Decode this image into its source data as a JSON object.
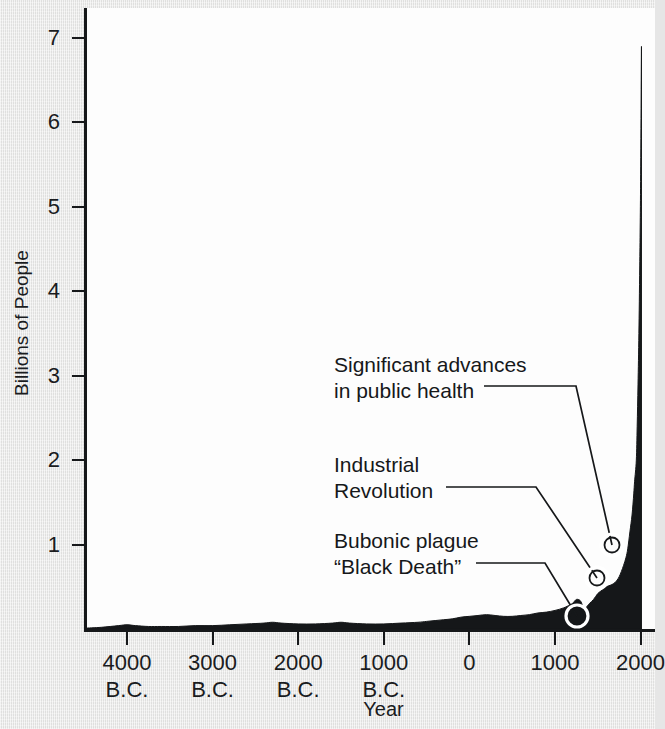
{
  "chart_data": {
    "type": "area",
    "title": "",
    "xlabel": "Year",
    "ylabel": "Billions of People",
    "ylim": [
      0,
      7.45
    ],
    "xlim": [
      -4500,
      2100
    ],
    "grid": false,
    "legend": null,
    "y_ticks": [
      {
        "value": 7,
        "label": "7"
      },
      {
        "value": 6,
        "label": "6"
      },
      {
        "value": 5,
        "label": "5"
      },
      {
        "value": 4,
        "label": "4"
      },
      {
        "value": 3,
        "label": "3"
      },
      {
        "value": 2,
        "label": "2"
      },
      {
        "value": 1,
        "label": "1"
      }
    ],
    "x_ticks": [
      {
        "value": -4000,
        "label": "4000\nB.C."
      },
      {
        "value": -3000,
        "label": "3000\nB.C."
      },
      {
        "value": -2000,
        "label": "2000\nB.C."
      },
      {
        "value": -1000,
        "label": "1000\nB.C."
      },
      {
        "value": 0,
        "label": "0"
      },
      {
        "value": 1000,
        "label": "1000"
      },
      {
        "value": 2000,
        "label": "2000"
      }
    ],
    "series": [
      {
        "name": "World population",
        "fill": "#151719",
        "x": [
          -4500,
          -4300,
          -4100,
          -4000,
          -3900,
          -3750,
          -3600,
          -3400,
          -3200,
          -3000,
          -2800,
          -2600,
          -2400,
          -2300,
          -2200,
          -2000,
          -1800,
          -1600,
          -1500,
          -1400,
          -1200,
          -1000,
          -800,
          -600,
          -500,
          -400,
          -300,
          -200,
          -100,
          0,
          100,
          200,
          300,
          400,
          500,
          600,
          700,
          800,
          900,
          1000,
          1100,
          1200,
          1250,
          1300,
          1340,
          1400,
          1450,
          1500,
          1550,
          1600,
          1650,
          1700,
          1750,
          1800,
          1830,
          1850,
          1875,
          1900,
          1920,
          1930,
          1950,
          1960,
          1970,
          1980,
          1990,
          2000,
          2010
        ],
        "y": [
          0.01,
          0.02,
          0.04,
          0.05,
          0.04,
          0.03,
          0.03,
          0.03,
          0.04,
          0.04,
          0.05,
          0.06,
          0.07,
          0.08,
          0.07,
          0.06,
          0.06,
          0.07,
          0.08,
          0.07,
          0.06,
          0.06,
          0.07,
          0.08,
          0.09,
          0.1,
          0.11,
          0.12,
          0.14,
          0.15,
          0.16,
          0.17,
          0.16,
          0.15,
          0.15,
          0.16,
          0.17,
          0.19,
          0.2,
          0.22,
          0.25,
          0.3,
          0.35,
          0.33,
          0.24,
          0.3,
          0.35,
          0.42,
          0.46,
          0.5,
          0.52,
          0.55,
          0.62,
          0.75,
          0.85,
          0.95,
          1.15,
          1.35,
          1.6,
          1.75,
          2.0,
          2.4,
          2.9,
          3.5,
          4.3,
          5.3,
          6.9
        ]
      }
    ],
    "annotations": [
      {
        "id": "public-health",
        "text": "Significant advances\nin public health",
        "text_x": 334,
        "text_y": 352,
        "leader": "M 484 386 L 576 386 L 612 545",
        "marker_x": 612,
        "marker_y": 545,
        "data_year": 1850,
        "data_value": 1.0
      },
      {
        "id": "industrial-revolution",
        "text": "Industrial\nRevolution",
        "text_x": 334,
        "text_y": 452,
        "leader": "M 446 487 L 536 487 L 597 578",
        "marker_x": 597,
        "marker_y": 578,
        "data_year": 1760,
        "data_value": 0.62
      },
      {
        "id": "black-death",
        "text": "Bubonic plague\n“Black Death”",
        "text_x": 334,
        "text_y": 528,
        "leader": "M 476 563 L 545 563 L 577 616",
        "marker_x": 577,
        "marker_y": 616,
        "data_year": 1348,
        "data_value": 0.24
      }
    ],
    "marker_style": {
      "outer_radius": 11,
      "inner_radius": 7.5,
      "ring_color": "#ffffff",
      "outline_color": "#16181a"
    },
    "colors": {
      "background": "#e8e8e7",
      "plot_background": "#fdfdfd",
      "axis": "#16181a",
      "area_fill": "#151719",
      "text": "#1a1c1e"
    }
  }
}
